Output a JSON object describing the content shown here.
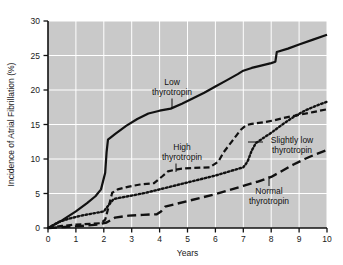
{
  "chart_data": {
    "type": "line",
    "title": "",
    "xlabel": "Years",
    "ylabel": "Incidence of Atrial Fibrillation (%)",
    "xlim": [
      0,
      10
    ],
    "ylim": [
      0,
      30
    ],
    "xticks": [
      "0",
      "1",
      "2",
      "3",
      "4",
      "5",
      "6",
      "7",
      "8",
      "9",
      "10"
    ],
    "yticks": [
      "0",
      "5",
      "10",
      "15",
      "20",
      "25",
      "30"
    ],
    "grid": true,
    "grid_color": "#ffffff",
    "plot_background": "#c9c9c9",
    "legend_position": "inline-annotations",
    "series": [
      {
        "name": "Low thyrotropin",
        "style": "solid",
        "color": "#111111",
        "x": [
          0,
          0.5,
          1.0,
          1.4,
          1.7,
          1.9,
          2.05,
          2.1,
          2.15,
          2.4,
          2.8,
          3.2,
          3.6,
          4.0,
          4.4,
          4.8,
          5.2,
          5.6,
          6.0,
          6.4,
          6.8,
          7.0,
          7.3,
          7.6,
          8.0,
          8.15,
          8.2,
          8.6,
          9.0,
          9.5,
          10.0
        ],
        "y": [
          0.0,
          1.1,
          2.4,
          3.6,
          4.6,
          5.6,
          8.0,
          11.0,
          12.8,
          13.6,
          14.8,
          15.8,
          16.6,
          17.0,
          17.3,
          18.0,
          18.8,
          19.6,
          20.5,
          21.4,
          22.3,
          22.8,
          23.2,
          23.5,
          23.9,
          24.1,
          25.5,
          26.0,
          26.6,
          27.3,
          28.0
        ]
      },
      {
        "name": "High thyrotropin",
        "style": "dashed",
        "color": "#111111",
        "x": [
          0,
          0.5,
          1.0,
          1.5,
          1.9,
          2.05,
          2.2,
          2.3,
          2.5,
          2.9,
          3.3,
          3.8,
          4.1,
          4.3,
          4.5,
          4.8,
          5.2,
          5.8,
          6.1,
          6.3,
          6.6,
          6.9,
          7.1,
          7.3,
          7.7,
          8.1,
          8.5,
          9.0,
          9.5,
          10.0
        ],
        "y": [
          0.0,
          0.3,
          0.5,
          0.6,
          0.7,
          1.2,
          3.5,
          5.1,
          5.6,
          6.0,
          6.3,
          6.5,
          7.5,
          8.2,
          8.4,
          8.6,
          8.7,
          8.8,
          9.6,
          11.0,
          12.6,
          14.2,
          14.9,
          15.1,
          15.3,
          15.6,
          16.0,
          16.4,
          16.8,
          17.2
        ]
      },
      {
        "name": "Slightly low thyrotropin",
        "style": "dotted",
        "color": "#111111",
        "x": [
          0,
          0.4,
          0.8,
          1.2,
          1.6,
          2.0,
          2.15,
          2.35,
          2.6,
          3.0,
          3.5,
          4.0,
          4.5,
          5.0,
          5.5,
          6.0,
          6.5,
          7.0,
          7.15,
          7.3,
          7.45,
          7.7,
          8.0,
          8.4,
          8.8,
          9.2,
          9.6,
          10.0
        ],
        "y": [
          0.0,
          0.9,
          1.4,
          1.8,
          2.1,
          2.4,
          3.2,
          4.2,
          4.4,
          4.7,
          5.1,
          5.6,
          6.1,
          6.6,
          7.1,
          7.6,
          8.2,
          8.8,
          9.6,
          11.2,
          12.3,
          13.0,
          13.8,
          15.0,
          16.1,
          17.0,
          17.7,
          18.3
        ]
      },
      {
        "name": "Normal thyrotropin",
        "style": "longdash",
        "color": "#111111",
        "x": [
          0,
          0.6,
          1.2,
          1.8,
          2.1,
          2.4,
          2.9,
          3.4,
          3.9,
          4.05,
          4.2,
          4.5,
          5.0,
          5.5,
          6.0,
          6.5,
          7.0,
          7.5,
          8.0,
          8.4,
          8.8,
          9.2,
          9.6,
          10.0
        ],
        "y": [
          0.0,
          0.15,
          0.3,
          0.5,
          0.8,
          1.5,
          1.8,
          1.9,
          2.0,
          2.4,
          3.1,
          3.4,
          3.9,
          4.4,
          4.9,
          5.5,
          6.1,
          6.7,
          7.4,
          8.3,
          9.2,
          10.0,
          10.7,
          11.3
        ]
      }
    ],
    "annotations": [
      {
        "name": "low-thyrotropin",
        "label_line1": "Low",
        "label_line2": "thyrotropin"
      },
      {
        "name": "high-thyrotropin",
        "label_line1": "High",
        "label_line2": "thyrotropin"
      },
      {
        "name": "slightly-low-thyrotropin",
        "label_line1": "Slightly low",
        "label_line2": "thyrotropin"
      },
      {
        "name": "normal-thyrotropin",
        "label_line1": "Normal",
        "label_line2": "thyrotropin"
      }
    ]
  }
}
